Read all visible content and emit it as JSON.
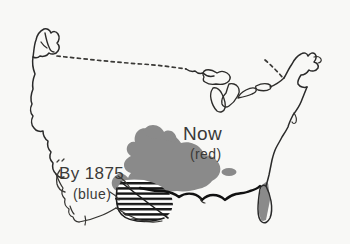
{
  "figure": {
    "kind": "hand-drawn-map",
    "background_color": "#f8f8f6",
    "ink_color": "#2a2a2a"
  },
  "annotations": {
    "now": {
      "title": "Now",
      "subtitle": "(red)",
      "fill_color": "#8a8a8a",
      "description_shape": "solid gray blob across south-central United States"
    },
    "by1875": {
      "title": "By 1875",
      "subtitle": "(blue)",
      "hatch_color": "#161616",
      "description_shape": "horizontally hatched area over Texas and western Gulf Coast"
    }
  },
  "features": {
    "northern_border": {
      "name": "US-Canada border",
      "style": "dashed"
    },
    "great_lakes": {
      "name": "Great Lakes",
      "style": "outline"
    },
    "outlier_patch": {
      "name": "isolated gray patch",
      "fill_color": "#8a8a8a"
    },
    "florida_shading": {
      "name": "Florida gray shading",
      "fill_color": "#8a8a8a"
    }
  }
}
